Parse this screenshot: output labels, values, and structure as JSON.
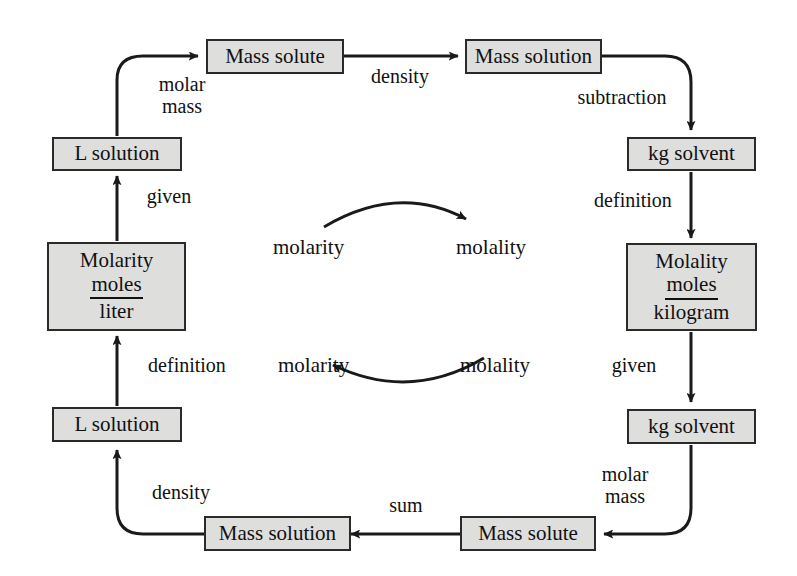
{
  "diagram": {
    "background_color": "#ffffff",
    "box_fill_color": "#dededd",
    "box_border_color": "#2a2a2a",
    "line_color": "#1a1a1a"
  },
  "nodes": {
    "top_mass_solute": {
      "label": "Mass solute"
    },
    "top_mass_solution": {
      "label": "Mass solution"
    },
    "left_l_solution_top": {
      "label": "L solution"
    },
    "molarity": {
      "title": "Molarity",
      "numerator": "moles",
      "denominator": "liter"
    },
    "left_l_solution_bottom": {
      "label": "L solution"
    },
    "bottom_mass_solution": {
      "label": "Mass solution"
    },
    "bottom_mass_solute": {
      "label": "Mass solute"
    },
    "right_kg_solvent_top": {
      "label": "kg solvent"
    },
    "molality": {
      "title": "Molality",
      "numerator": "moles",
      "denominator": "kilogram"
    },
    "right_kg_solvent_bottom": {
      "label": "kg solvent"
    }
  },
  "edge_labels": {
    "molar_mass_top": {
      "line1": "molar",
      "line2": "mass"
    },
    "density_top": "density",
    "subtraction": "subtraction",
    "definition_right": "definition",
    "given_right": "given",
    "molar_mass_bottom": {
      "line1": "molar",
      "line2": "mass"
    },
    "sum": "sum",
    "density_bottom": "density",
    "definition_left": "definition",
    "given_left": "given"
  },
  "cycle": {
    "top_from": "molarity",
    "top_to": "molality",
    "bottom_from": "molality",
    "bottom_to": "molarity"
  }
}
